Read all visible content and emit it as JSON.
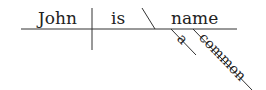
{
  "diagram": {
    "type": "sentence-diagram",
    "subject": "John",
    "verb": "is",
    "predicate_nominative": "name",
    "modifiers": [
      "a",
      "common"
    ],
    "line_color": "#333333",
    "text_color": "#222222"
  }
}
